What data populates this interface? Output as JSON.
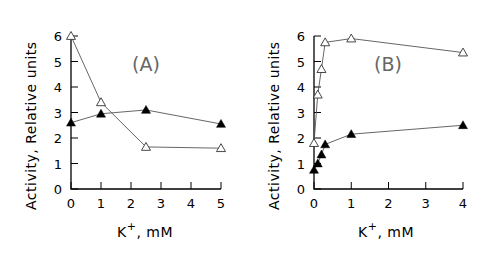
{
  "chart_data": [
    {
      "type": "line",
      "panel_label": "(A)",
      "title": "",
      "xlabel": "K+, mM",
      "ylabel": "Activity, Relative units",
      "xlim": [
        0,
        5
      ],
      "ylim": [
        0,
        6
      ],
      "xticks": [
        "0",
        "1",
        "2",
        "3",
        "4",
        "5"
      ],
      "yticks": [
        "0",
        "1",
        "2",
        "3",
        "4",
        "5",
        "6"
      ],
      "grid": false,
      "legend": null,
      "series": [
        {
          "name": "open triangles",
          "marker": "open-triangle",
          "x": [
            0,
            1,
            2.5,
            5
          ],
          "values": [
            6.0,
            3.4,
            1.65,
            1.6
          ]
        },
        {
          "name": "filled triangles",
          "marker": "filled-triangle",
          "x": [
            0,
            1,
            2.5,
            5
          ],
          "values": [
            2.6,
            2.95,
            3.1,
            2.55
          ]
        }
      ]
    },
    {
      "type": "line",
      "panel_label": "(B)",
      "title": "",
      "xlabel": "K+, mM",
      "ylabel": "Activity, Relative units",
      "xlim": [
        0,
        4
      ],
      "ylim": [
        0,
        6
      ],
      "xticks": [
        "0",
        "1",
        "2",
        "3",
        "4"
      ],
      "yticks": [
        "0",
        "1",
        "2",
        "3",
        "4",
        "5",
        "6"
      ],
      "grid": false,
      "legend": null,
      "series": [
        {
          "name": "open triangles",
          "marker": "open-triangle",
          "x": [
            0,
            0.1,
            0.2,
            0.3,
            1,
            4
          ],
          "values": [
            1.8,
            3.7,
            4.7,
            5.75,
            5.9,
            5.35
          ]
        },
        {
          "name": "filled triangles",
          "marker": "filled-triangle",
          "x": [
            0,
            0.1,
            0.2,
            0.3,
            1,
            4
          ],
          "values": [
            0.75,
            1.0,
            1.35,
            1.75,
            2.15,
            2.5
          ]
        }
      ]
    }
  ],
  "panels": {
    "a": {
      "label": "(A)",
      "xlabel_main": "K",
      "xlabel_sup": "+",
      "xlabel_rest": ", mM",
      "ylabel": "Activity, Relative units"
    },
    "b": {
      "label": "(B)",
      "xlabel_main": "K",
      "xlabel_sup": "+",
      "xlabel_rest": ", mM",
      "ylabel": "Activity, Relative units"
    }
  }
}
